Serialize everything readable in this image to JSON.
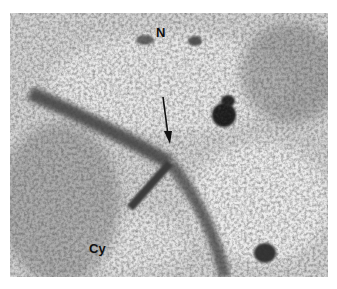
{
  "figure": {
    "type": "electron micrograph",
    "labels": {
      "nucleus": "N",
      "cytoplasm": "Cy"
    },
    "annotations": [
      "arrow pointing to nuclear envelope junction"
    ]
  }
}
